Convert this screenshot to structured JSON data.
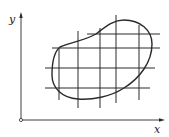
{
  "figure": {
    "type": "region-grid-partition",
    "axes": {
      "x_label": "x",
      "y_label": "y",
      "origin_marker": "open-circle"
    },
    "colors": {
      "stroke": "#2a2a2a",
      "background": "#ffffff"
    },
    "region": {
      "description": "closed curve region in xy-plane",
      "shape": "blob"
    },
    "grid": {
      "horizontal_lines_y": [
        34,
        48,
        68,
        88
      ],
      "vertical_lines_x": [
        59,
        78,
        100,
        116,
        139
      ]
    }
  }
}
